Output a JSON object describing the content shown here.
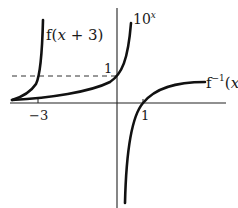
{
  "figure": {
    "type": "function-graph",
    "axes": {
      "origin_px": [
        117,
        103
      ],
      "unit_px": {
        "x": 26.3,
        "y": 27
      },
      "x_tick_labels": [
        "−3",
        "1"
      ],
      "x_tick_values": [
        -3,
        1
      ],
      "y_tick_labels": [
        "1"
      ],
      "y_tick_values": [
        1
      ]
    },
    "curves": [
      {
        "name": "f(x+3)",
        "label_main": "f(",
        "label_var": "x",
        "label_rest": " + 3)",
        "expression": "10^(x+3)"
      },
      {
        "name": "10^x",
        "label_base": "10",
        "label_exp": "x",
        "expression": "10^x"
      },
      {
        "name": "f^-1(x)",
        "label_main": "f",
        "label_sup": "−1",
        "label_open": "(",
        "label_var": "x",
        "label_close": ")",
        "expression": "log10(x)"
      }
    ],
    "dashed_line": {
      "y": 1,
      "description": "horizontal asymptote reference y = 1"
    },
    "colors": {
      "curve": "#111111",
      "axis": "#222222",
      "dashed": "#333333"
    }
  }
}
